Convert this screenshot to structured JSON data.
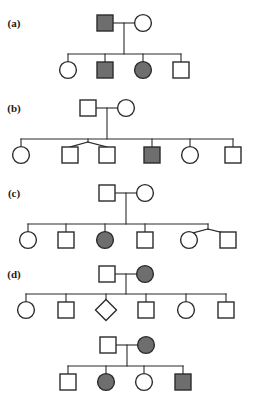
{
  "figure": {
    "width": 262,
    "height": 401,
    "background_color": "#ffffff",
    "line_color": "#2b2b2b",
    "symbol_stroke_color": "#2b2b2b",
    "unaffected_fill": "#ffffff",
    "affected_fill": "#6e6e6e",
    "line_width": 1.1,
    "symbol_stroke_width": 1.4,
    "symbol_size": 16
  },
  "legend_semantics": {
    "square": "male",
    "circle": "female",
    "diamond": "sex unspecified",
    "filled": "affected",
    "open": "unaffected"
  },
  "panels": [
    {
      "id": "panel-a",
      "label": "(a)",
      "label_x": 14,
      "label_y": 27,
      "generations": 2,
      "individuals": [
        {
          "name": "a-i-1",
          "shape": "square",
          "affected": true,
          "cx": 105,
          "cy": 23
        },
        {
          "name": "a-i-2",
          "shape": "circle",
          "affected": false,
          "cx": 143,
          "cy": 23
        },
        {
          "name": "a-ii-1",
          "shape": "circle",
          "affected": false,
          "cx": 68,
          "cy": 70
        },
        {
          "name": "a-ii-2",
          "shape": "square",
          "affected": true,
          "cx": 105,
          "cy": 70
        },
        {
          "name": "a-ii-3",
          "shape": "circle",
          "affected": true,
          "cx": 143,
          "cy": 70
        },
        {
          "name": "a-ii-4",
          "shape": "square",
          "affected": false,
          "cx": 181,
          "cy": 70
        }
      ],
      "lines": [
        {
          "name": "a-mating-line",
          "x1": 113,
          "y1": 23,
          "x2": 135,
          "y2": 23
        },
        {
          "name": "a-descent-line",
          "x1": 124,
          "y1": 23,
          "x2": 124,
          "y2": 54
        },
        {
          "name": "a-sibship-line",
          "x1": 68,
          "y1": 54,
          "x2": 181,
          "y2": 54
        },
        {
          "name": "a-drop-1",
          "x1": 68,
          "y1": 54,
          "x2": 68,
          "y2": 62
        },
        {
          "name": "a-drop-2",
          "x1": 105,
          "y1": 54,
          "x2": 105,
          "y2": 62
        },
        {
          "name": "a-drop-3",
          "x1": 143,
          "y1": 54,
          "x2": 143,
          "y2": 62
        },
        {
          "name": "a-drop-4",
          "x1": 181,
          "y1": 54,
          "x2": 181,
          "y2": 62
        }
      ]
    },
    {
      "id": "panel-b",
      "label": "(b)",
      "label_x": 14,
      "label_y": 112,
      "generations": 2,
      "individuals": [
        {
          "name": "b-i-1",
          "shape": "square",
          "affected": false,
          "cx": 88,
          "cy": 108
        },
        {
          "name": "b-i-2",
          "shape": "circle",
          "affected": false,
          "cx": 126,
          "cy": 108
        },
        {
          "name": "b-ii-1",
          "shape": "circle",
          "affected": false,
          "cx": 21,
          "cy": 155
        },
        {
          "name": "b-ii-2",
          "shape": "square",
          "affected": false,
          "cx": 70,
          "cy": 155
        },
        {
          "name": "b-ii-3",
          "shape": "square",
          "affected": false,
          "cx": 107,
          "cy": 155
        },
        {
          "name": "b-ii-4",
          "shape": "square",
          "affected": true,
          "cx": 152,
          "cy": 155
        },
        {
          "name": "b-ii-5",
          "shape": "circle",
          "affected": false,
          "cx": 190,
          "cy": 155
        },
        {
          "name": "b-ii-6",
          "shape": "square",
          "affected": false,
          "cx": 233,
          "cy": 155
        }
      ],
      "lines": [
        {
          "name": "b-mating-line",
          "x1": 96,
          "y1": 108,
          "x2": 118,
          "y2": 108
        },
        {
          "name": "b-descent-line",
          "x1": 107,
          "y1": 108,
          "x2": 107,
          "y2": 139
        },
        {
          "name": "b-sibship-line",
          "x1": 21,
          "y1": 139,
          "x2": 233,
          "y2": 139
        },
        {
          "name": "b-drop-1",
          "x1": 21,
          "y1": 139,
          "x2": 21,
          "y2": 147
        },
        {
          "name": "b-twin-stem",
          "x1": 88,
          "y1": 139,
          "x2": 88,
          "y2": 142
        },
        {
          "name": "b-twin-arm-left",
          "x1": 88,
          "y1": 142,
          "x2": 70,
          "y2": 147
        },
        {
          "name": "b-twin-arm-right",
          "x1": 88,
          "y1": 142,
          "x2": 107,
          "y2": 147
        },
        {
          "name": "b-drop-4",
          "x1": 152,
          "y1": 139,
          "x2": 152,
          "y2": 147
        },
        {
          "name": "b-drop-5",
          "x1": 190,
          "y1": 139,
          "x2": 190,
          "y2": 147
        },
        {
          "name": "b-drop-6",
          "x1": 233,
          "y1": 139,
          "x2": 233,
          "y2": 147
        }
      ]
    },
    {
      "id": "panel-c",
      "label": "(c)",
      "label_x": 14,
      "label_y": 197,
      "generations": 2,
      "individuals": [
        {
          "name": "c-i-1",
          "shape": "square",
          "affected": false,
          "cx": 107,
          "cy": 193
        },
        {
          "name": "c-i-2",
          "shape": "circle",
          "affected": false,
          "cx": 145,
          "cy": 193
        },
        {
          "name": "c-ii-1",
          "shape": "circle",
          "affected": false,
          "cx": 28,
          "cy": 240
        },
        {
          "name": "c-ii-2",
          "shape": "square",
          "affected": false,
          "cx": 66,
          "cy": 240
        },
        {
          "name": "c-ii-3",
          "shape": "circle",
          "affected": true,
          "cx": 105,
          "cy": 240
        },
        {
          "name": "c-ii-4",
          "shape": "square",
          "affected": false,
          "cx": 145,
          "cy": 240
        },
        {
          "name": "c-ii-5",
          "shape": "circle",
          "affected": false,
          "cx": 189,
          "cy": 240
        },
        {
          "name": "c-ii-5-spouse",
          "shape": "square",
          "affected": false,
          "cx": 228,
          "cy": 240
        }
      ],
      "lines": [
        {
          "name": "c-mating-line",
          "x1": 115,
          "y1": 193,
          "x2": 137,
          "y2": 193
        },
        {
          "name": "c-descent-line",
          "x1": 126,
          "y1": 193,
          "x2": 126,
          "y2": 224
        },
        {
          "name": "c-sibship-line",
          "x1": 28,
          "y1": 224,
          "x2": 208,
          "y2": 224
        },
        {
          "name": "c-drop-1",
          "x1": 28,
          "y1": 224,
          "x2": 28,
          "y2": 232
        },
        {
          "name": "c-drop-2",
          "x1": 66,
          "y1": 224,
          "x2": 66,
          "y2": 232
        },
        {
          "name": "c-drop-3",
          "x1": 105,
          "y1": 224,
          "x2": 105,
          "y2": 232
        },
        {
          "name": "c-drop-4",
          "x1": 145,
          "y1": 224,
          "x2": 145,
          "y2": 232
        },
        {
          "name": "c-couple-stem",
          "x1": 208,
          "y1": 224,
          "x2": 208,
          "y2": 229
        },
        {
          "name": "c-couple-arm-left",
          "x1": 208,
          "y1": 229,
          "x2": 189,
          "y2": 234
        },
        {
          "name": "c-couple-arm-right",
          "x1": 208,
          "y1": 229,
          "x2": 228,
          "y2": 234
        }
      ]
    },
    {
      "id": "panel-d",
      "label": "(d)",
      "label_x": 14,
      "label_y": 278,
      "generations": 3,
      "individuals": [
        {
          "name": "d-i-1",
          "shape": "square",
          "affected": false,
          "cx": 107,
          "cy": 274
        },
        {
          "name": "d-i-2",
          "shape": "circle",
          "affected": true,
          "cx": 145,
          "cy": 274
        },
        {
          "name": "d-ii-1",
          "shape": "circle",
          "affected": false,
          "cx": 26,
          "cy": 310
        },
        {
          "name": "d-ii-2",
          "shape": "square",
          "affected": false,
          "cx": 66,
          "cy": 310
        },
        {
          "name": "d-ii-3",
          "shape": "diamond",
          "affected": false,
          "cx": 106,
          "cy": 310
        },
        {
          "name": "d-ii-4",
          "shape": "square",
          "affected": false,
          "cx": 146,
          "cy": 310
        },
        {
          "name": "d-ii-5",
          "shape": "circle",
          "affected": false,
          "cx": 186,
          "cy": 310
        },
        {
          "name": "d-ii-6",
          "shape": "square",
          "affected": false,
          "cx": 226,
          "cy": 310
        },
        {
          "name": "d-ii-4-spouse",
          "shape": "circle",
          "affected": true,
          "cx": 146,
          "cy": 345
        },
        {
          "name": "d-ii-4-partner-square",
          "shape": "square",
          "affected": false,
          "cx": 108,
          "cy": 345
        },
        {
          "name": "d-iii-1",
          "shape": "square",
          "affected": false,
          "cx": 68,
          "cy": 382
        },
        {
          "name": "d-iii-2",
          "shape": "circle",
          "affected": true,
          "cx": 106,
          "cy": 382
        },
        {
          "name": "d-iii-3",
          "shape": "circle",
          "affected": false,
          "cx": 144,
          "cy": 382
        },
        {
          "name": "d-iii-4",
          "shape": "square",
          "affected": true,
          "cx": 183,
          "cy": 382
        }
      ],
      "lines": [
        {
          "name": "d-mating-line-1",
          "x1": 115,
          "y1": 274,
          "x2": 137,
          "y2": 274
        },
        {
          "name": "d-descent-line-1",
          "x1": 126,
          "y1": 274,
          "x2": 126,
          "y2": 294
        },
        {
          "name": "d-sibship-line-1",
          "x1": 26,
          "y1": 294,
          "x2": 226,
          "y2": 294
        },
        {
          "name": "d-drop-1",
          "x1": 26,
          "y1": 294,
          "x2": 26,
          "y2": 302
        },
        {
          "name": "d-drop-2",
          "x1": 66,
          "y1": 294,
          "x2": 66,
          "y2": 302
        },
        {
          "name": "d-drop-3",
          "x1": 106,
          "y1": 294,
          "x2": 106,
          "y2": 301
        },
        {
          "name": "d-drop-4",
          "x1": 146,
          "y1": 294,
          "x2": 146,
          "y2": 302
        },
        {
          "name": "d-drop-5",
          "x1": 186,
          "y1": 294,
          "x2": 186,
          "y2": 302
        },
        {
          "name": "d-drop-6",
          "x1": 226,
          "y1": 294,
          "x2": 226,
          "y2": 302
        },
        {
          "name": "d-mating-line-2",
          "x1": 116,
          "y1": 345,
          "x2": 138,
          "y2": 345
        },
        {
          "name": "d-descent-line-2",
          "x1": 127,
          "y1": 345,
          "x2": 127,
          "y2": 366
        },
        {
          "name": "d-sibship-line-2",
          "x1": 68,
          "y1": 366,
          "x2": 183,
          "y2": 366
        },
        {
          "name": "d-drop-7",
          "x1": 68,
          "y1": 366,
          "x2": 68,
          "y2": 374
        },
        {
          "name": "d-drop-8",
          "x1": 106,
          "y1": 366,
          "x2": 106,
          "y2": 374
        },
        {
          "name": "d-drop-9",
          "x1": 144,
          "y1": 366,
          "x2": 144,
          "y2": 374
        },
        {
          "name": "d-drop-10",
          "x1": 183,
          "y1": 366,
          "x2": 183,
          "y2": 374
        }
      ]
    }
  ]
}
